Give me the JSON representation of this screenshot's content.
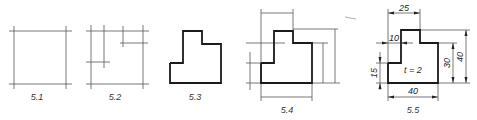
{
  "figures": [
    {
      "id": "5.1",
      "label": "5.1",
      "description": "bounding construction lines"
    },
    {
      "id": "5.2",
      "label": "5.2",
      "description": "construction lines for steps"
    },
    {
      "id": "5.3",
      "label": "5.3",
      "description": "outline traced in thick line"
    },
    {
      "id": "5.4",
      "label": "5.4",
      "description": "extension and dimension lines added"
    },
    {
      "id": "5.5",
      "label": "5.5",
      "description": "fully dimensioned part"
    }
  ],
  "dimensions": {
    "top_width": "25",
    "step_width": "10",
    "left_height": "15",
    "right_height_inner": "30",
    "right_height_total": "40",
    "bottom_width": "40",
    "thickness_note": "t = 2"
  },
  "colors": {
    "outline": "#1a1a1a",
    "construction": "#555555",
    "background": "#ffffff"
  }
}
